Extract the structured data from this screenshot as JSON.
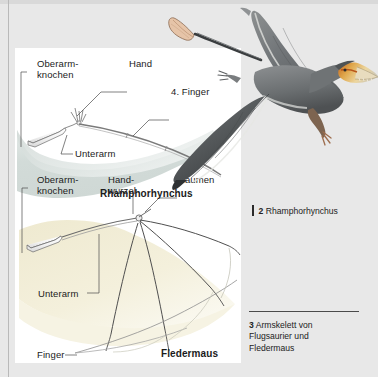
{
  "page": {
    "background_color": "#e8e8e8",
    "panel_color": "#ffffff"
  },
  "figure_panel": {
    "pterosaur_diagram": {
      "title": "Rhamphorhynchus",
      "wing_membrane_color": "#d6dedb",
      "labels": [
        {
          "id": "oberarmknochen",
          "line1": "Oberarm-",
          "line2": "knochen"
        },
        {
          "id": "hand",
          "text": "Hand"
        },
        {
          "id": "vierter-finger",
          "text": "4. Finger"
        },
        {
          "id": "unterarm",
          "text": "Unterarm"
        }
      ]
    },
    "bat_diagram": {
      "title": "Fledermaus",
      "wing_membrane_color": "#f1edd6",
      "labels": [
        {
          "id": "oberarmknochen",
          "line1": "Oberarm-",
          "line2": "knochen"
        },
        {
          "id": "handwurzel",
          "line1": "Hand-",
          "line2": "wurzel"
        },
        {
          "id": "daumen",
          "text": "Daumen"
        },
        {
          "id": "unterarm",
          "text": "Unterarm"
        },
        {
          "id": "finger",
          "text": "Finger"
        }
      ]
    }
  },
  "illustration": {
    "name": "rhamphorhynchus-flying",
    "body_color": "#6f7375",
    "wing_dark_color": "#4a4a48",
    "beak_color": "#d9a44a",
    "throat_color": "#c96a2a",
    "tail_vane_color": "#e8bfa0"
  },
  "captions": [
    {
      "number": "2",
      "text": "Rhamphorhynchus"
    },
    {
      "number": "3",
      "line1": "Armskelett von",
      "line2": "Flugsaurier und",
      "line3": "Fledermaus"
    }
  ]
}
